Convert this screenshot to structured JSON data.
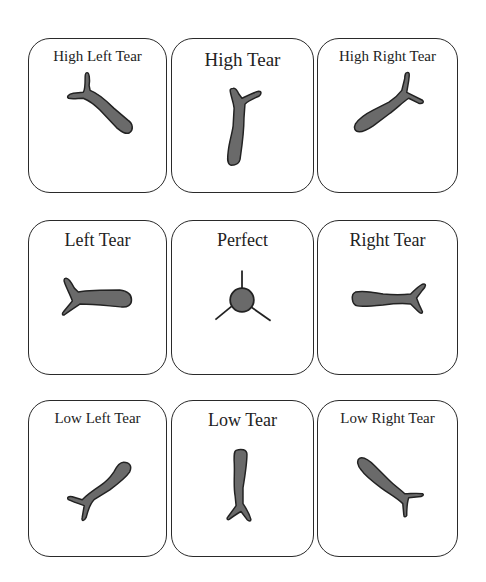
{
  "diagram": {
    "cards": [
      {
        "id": "high-left-tear",
        "label": "High Left Tear"
      },
      {
        "id": "high-tear",
        "label": "High Tear"
      },
      {
        "id": "high-right-tear",
        "label": "High Right Tear"
      },
      {
        "id": "left-tear",
        "label": "Left Tear"
      },
      {
        "id": "perfect",
        "label": "Perfect"
      },
      {
        "id": "right-tear",
        "label": "Right Tear"
      },
      {
        "id": "low-left-tear",
        "label": "Low Left Tear"
      },
      {
        "id": "low-tear",
        "label": "Low Tear"
      },
      {
        "id": "low-right-tear",
        "label": "Low Right Tear"
      }
    ],
    "colors": {
      "fill": "#6a6a6a",
      "stroke": "#222222",
      "border": "#2a2a2a"
    }
  }
}
